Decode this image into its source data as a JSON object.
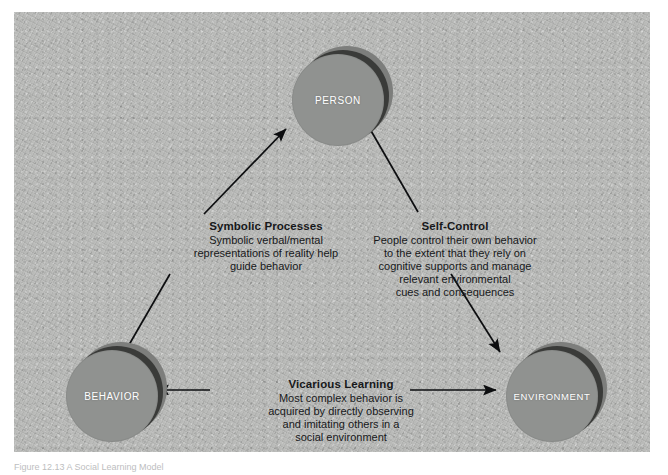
{
  "figure": {
    "caption": "Figure 12.13  A Social Learning Model",
    "panel_bg": "#b9bab8",
    "node_fill": "#909290",
    "node_shadow": "#3a3b39",
    "node_back": "#7d7e7c",
    "text_color": "#17181a"
  },
  "nodes": [
    {
      "id": "person",
      "label": "PERSON"
    },
    {
      "id": "behavior",
      "label": "BEHAVIOR"
    },
    {
      "id": "environment",
      "label": "ENVIRONMENT"
    }
  ],
  "blocks": [
    {
      "id": "symbolic",
      "title": "Symbolic Processes",
      "lines": [
        "Symbolic verbal/mental",
        "representations of reality help",
        "guide behavior"
      ]
    },
    {
      "id": "self_control",
      "title": "Self-Control",
      "lines": [
        "People control their own behavior",
        "to the extent that they rely on",
        "cognitive supports and manage",
        "relevant environmental",
        "cues and consequences"
      ]
    },
    {
      "id": "vicarious",
      "title": "Vicarious Learning",
      "lines": [
        "Most complex behavior is",
        "acquired by directly observing",
        "and imitating others in a",
        "social environment"
      ]
    }
  ],
  "arrows": [
    {
      "id": "behavior-to-person",
      "from": "BEHAVIOR",
      "to": "PERSON",
      "direction": "one-way"
    },
    {
      "id": "person-to-environment",
      "from": "PERSON",
      "to": "ENVIRONMENT",
      "direction": "one-way"
    },
    {
      "id": "behavior-environment",
      "from": "BEHAVIOR",
      "to": "ENVIRONMENT",
      "direction": "two-way"
    }
  ]
}
